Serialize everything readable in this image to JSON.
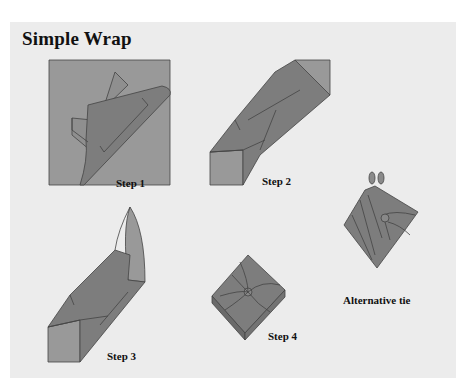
{
  "title": "Simple Wrap",
  "steps": [
    {
      "label": "Step 1"
    },
    {
      "label": "Step 2"
    },
    {
      "label": "Step 3"
    },
    {
      "label": "Step 4"
    }
  ],
  "alternative": {
    "label": "Alternative tie"
  },
  "colors": {
    "background": "#ececec",
    "cloth_light": "#9a9a9a",
    "cloth_mid": "#858585",
    "cloth_dark": "#6f6f6f",
    "outline": "#444444"
  }
}
